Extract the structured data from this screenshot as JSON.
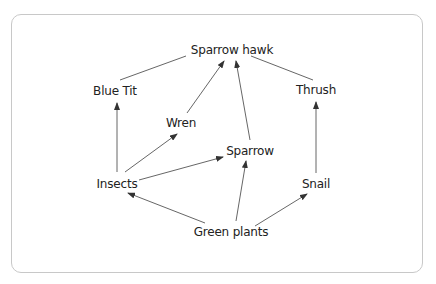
{
  "diagram": {
    "type": "food-web",
    "nodes": [
      {
        "id": "sparrow_hawk",
        "label": "Sparrow hawk",
        "x": 232,
        "y": 50
      },
      {
        "id": "blue_tit",
        "label": "Blue Tit",
        "x": 115,
        "y": 91
      },
      {
        "id": "thrush",
        "label": "Thrush",
        "x": 316,
        "y": 90
      },
      {
        "id": "wren",
        "label": "Wren",
        "x": 181,
        "y": 123
      },
      {
        "id": "sparrow",
        "label": "Sparrow",
        "x": 250,
        "y": 151
      },
      {
        "id": "insects",
        "label": "Insects",
        "x": 117,
        "y": 184
      },
      {
        "id": "snail",
        "label": "Snail",
        "x": 316,
        "y": 184
      },
      {
        "id": "green_plants",
        "label": "Green plants",
        "x": 231,
        "y": 232
      }
    ],
    "edges": [
      {
        "from": "blue_tit",
        "to": "sparrow_hawk",
        "arrow": false
      },
      {
        "from": "thrush",
        "to": "sparrow_hawk",
        "arrow": false
      },
      {
        "from": "wren",
        "to": "sparrow_hawk",
        "arrow": true
      },
      {
        "from": "sparrow",
        "to": "sparrow_hawk",
        "arrow": true
      },
      {
        "from": "insects",
        "to": "blue_tit",
        "arrow": true
      },
      {
        "from": "insects",
        "to": "wren",
        "arrow": true
      },
      {
        "from": "insects",
        "to": "sparrow",
        "arrow": true
      },
      {
        "from": "green_plants",
        "to": "insects",
        "arrow": true
      },
      {
        "from": "green_plants",
        "to": "sparrow",
        "arrow": true
      },
      {
        "from": "green_plants",
        "to": "snail",
        "arrow": true
      },
      {
        "from": "snail",
        "to": "thrush",
        "arrow": true
      }
    ]
  }
}
